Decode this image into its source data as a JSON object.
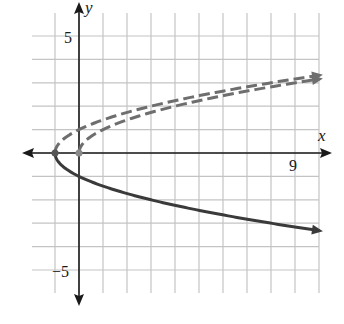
{
  "chart_data": {
    "type": "line",
    "title": "",
    "xlabel": "x",
    "ylabel": "y",
    "xlim": [
      -2,
      10
    ],
    "ylim": [
      -6,
      6
    ],
    "grid": true,
    "tick_labels": {
      "x": [
        {
          "value": 9,
          "label": "9"
        }
      ],
      "y": [
        {
          "value": 5,
          "label": "5"
        },
        {
          "value": -5,
          "label": "−5"
        }
      ]
    },
    "series": [
      {
        "name": "y = sqrt(x)",
        "style": "dashed",
        "color": "#6e6e6e",
        "start_point": [
          0,
          0
        ],
        "x": [
          0,
          1,
          4,
          9,
          10
        ],
        "values": [
          0,
          1,
          2,
          3,
          3.16
        ]
      },
      {
        "name": "y = sqrt(x + 1)",
        "style": "dashed",
        "color": "#6e6e6e",
        "start_point": [
          -1,
          0
        ],
        "x": [
          -1,
          0,
          3,
          8,
          10
        ],
        "values": [
          0,
          1,
          2,
          3,
          3.32
        ]
      },
      {
        "name": "y = -sqrt(x + 1)",
        "style": "solid",
        "color": "#3a3a3a",
        "start_point": [
          -1,
          0
        ],
        "x": [
          -1,
          0,
          3,
          8,
          10
        ],
        "values": [
          0,
          -1,
          -2,
          -3,
          -3.32
        ]
      }
    ],
    "points": [
      {
        "x": -1,
        "y": 0,
        "color": "#555555"
      },
      {
        "x": 0,
        "y": 0,
        "color": "#8a8a8a"
      }
    ]
  },
  "axes": {
    "x_label": "x",
    "y_label": "y",
    "x_tick_9": "9",
    "y_tick_5": "5",
    "y_tick_neg5": "−5"
  },
  "colors": {
    "grid": "#c4c4c4",
    "axis": "#1a1a1a",
    "dashed": "#6e6e6e",
    "solid": "#3a3a3a"
  }
}
